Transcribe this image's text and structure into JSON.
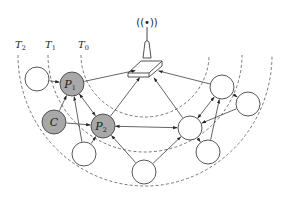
{
  "diagram": {
    "type": "wireless-sensor-network-levels",
    "base_station": {
      "name": "base-station",
      "icon": "antenna-tower-icon",
      "signal_glyph": "((•))"
    },
    "rings": [
      {
        "id": "T0",
        "label": "T",
        "sub": "0",
        "cx": 145,
        "cy": 55,
        "rx": 64,
        "ry": 62
      },
      {
        "id": "T1",
        "label": "T",
        "sub": "1",
        "cx": 145,
        "cy": 55,
        "rx": 97,
        "ry": 97
      },
      {
        "id": "T2",
        "label": "T",
        "sub": "2",
        "cx": 145,
        "cy": 55,
        "rx": 127,
        "ry": 131
      }
    ],
    "nodes": [
      {
        "id": "W1",
        "label": "",
        "sub": "",
        "x": 37,
        "y": 79,
        "fill": "white"
      },
      {
        "id": "P1",
        "label": "P",
        "sub": "1",
        "x": 72,
        "y": 84,
        "fill": "gray"
      },
      {
        "id": "C",
        "label": "C",
        "sub": "",
        "x": 54,
        "y": 122,
        "fill": "gray"
      },
      {
        "id": "P2",
        "label": "P",
        "sub": "2",
        "x": 103,
        "y": 126,
        "fill": "gray"
      },
      {
        "id": "B1",
        "label": "",
        "sub": "",
        "x": 84,
        "y": 154,
        "fill": "white"
      },
      {
        "id": "B2",
        "label": "",
        "sub": "",
        "x": 144,
        "y": 172,
        "fill": "white"
      },
      {
        "id": "R3",
        "label": "",
        "sub": "",
        "x": 190,
        "y": 128,
        "fill": "white"
      },
      {
        "id": "B3",
        "label": "",
        "sub": "",
        "x": 208,
        "y": 152,
        "fill": "white"
      },
      {
        "id": "R1",
        "label": "",
        "sub": "",
        "x": 222,
        "y": 87,
        "fill": "white"
      },
      {
        "id": "R2",
        "label": "",
        "sub": "",
        "x": 248,
        "y": 104,
        "fill": "white"
      }
    ],
    "edges": [
      {
        "from": "W1",
        "to": "P1",
        "arrow": "end"
      },
      {
        "from": "P1",
        "to": "BS",
        "arrow": "end"
      },
      {
        "from": "C",
        "to": "P1",
        "arrow": "end"
      },
      {
        "from": "C",
        "to": "P2",
        "arrow": "end"
      },
      {
        "from": "P1",
        "to": "P2",
        "arrow": "both"
      },
      {
        "from": "B1",
        "to": "P1",
        "arrow": "end"
      },
      {
        "from": "B1",
        "to": "P2",
        "arrow": "end"
      },
      {
        "from": "P2",
        "to": "BS",
        "arrow": "end"
      },
      {
        "from": "P2",
        "to": "R3",
        "arrow": "both"
      },
      {
        "from": "B2",
        "to": "P2",
        "arrow": "end"
      },
      {
        "from": "B2",
        "to": "R3",
        "arrow": "end"
      },
      {
        "from": "R3",
        "to": "BS",
        "arrow": "end"
      },
      {
        "from": "R1",
        "to": "BS",
        "arrow": "end"
      },
      {
        "from": "R3",
        "to": "R1",
        "arrow": "both"
      },
      {
        "from": "R2",
        "to": "R3",
        "arrow": "end"
      },
      {
        "from": "R1",
        "to": "R2",
        "arrow": "end"
      },
      {
        "from": "B3",
        "to": "R1",
        "arrow": "end"
      },
      {
        "from": "R3",
        "to": "B3",
        "arrow": "end"
      }
    ],
    "node_radius": 12,
    "colors": {
      "gray_node": "#a8a8a8",
      "white_node": "#ffffff",
      "stroke": "#444444",
      "arc": "#555555"
    }
  }
}
